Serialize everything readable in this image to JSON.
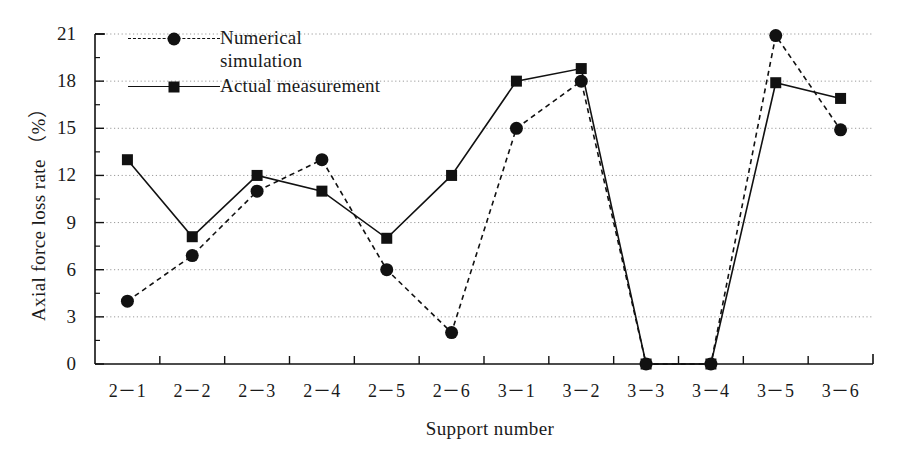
{
  "chart_data": {
    "type": "line",
    "title": "",
    "xlabel": "Support number",
    "ylabel": "Axial force loss rate （%）",
    "categories": [
      "2－1",
      "2－2",
      "2－3",
      "2－4",
      "2－5",
      "2－6",
      "3－1",
      "3－2",
      "3－3",
      "3－4",
      "3－5",
      "3－6"
    ],
    "ylim": [
      0,
      21
    ],
    "yticks": [
      0,
      3,
      6,
      9,
      12,
      15,
      18,
      21
    ],
    "ytick_labels": [
      "0",
      "3",
      "6",
      "9",
      "12",
      "15",
      "18",
      "21"
    ],
    "minor_ticks": true,
    "grid": "horizontal-dotted",
    "legend_position": "top-left-inside",
    "series": [
      {
        "name": "Numerical simulation",
        "marker": "circle",
        "linestyle": "dashed",
        "color": "#111111",
        "values": [
          4,
          6.9,
          11,
          13,
          6,
          2,
          15,
          18,
          0,
          0,
          20.9,
          14.9
        ]
      },
      {
        "name": "Actual measurement",
        "marker": "square",
        "linestyle": "solid",
        "color": "#111111",
        "values": [
          13,
          8.1,
          12,
          11,
          8,
          12,
          18,
          18.8,
          0,
          0,
          17.9,
          16.9
        ]
      }
    ]
  },
  "legend": {
    "items": [
      {
        "label_line1": "Numerical",
        "label_line2": "simulation",
        "marker": "circle",
        "linestyle": "dashed"
      },
      {
        "label_line1": "Actual measurement",
        "label_line2": "",
        "marker": "square",
        "linestyle": "solid"
      }
    ]
  },
  "axes": {
    "y_title": "Axial force loss rate （%）",
    "x_title": "Support number"
  }
}
